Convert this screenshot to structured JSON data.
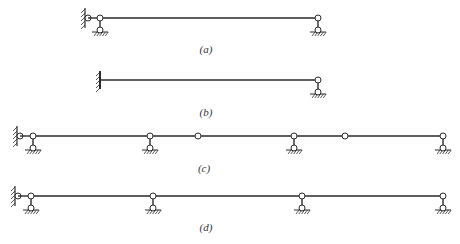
{
  "figure": {
    "background": "#ffffff",
    "line_color": "#2a2a2a",
    "diagrams": [
      {
        "id": "a",
        "label": "(a)",
        "label_pos": [
          206,
          50
        ],
        "beam_y": 18,
        "beam_x": [
          100,
          318
        ],
        "elements": [
          {
            "type": "wall-pin",
            "x": 88,
            "y": 18
          },
          {
            "type": "link-bar",
            "x1": 88,
            "x2": 100,
            "y": 18
          },
          {
            "type": "pinned-support",
            "x": 100,
            "y": 18
          },
          {
            "type": "pinned-support",
            "x": 318,
            "y": 18
          }
        ]
      },
      {
        "id": "b",
        "label": "(b)",
        "label_pos": [
          206,
          113
        ],
        "beam_y": 80,
        "beam_x": [
          100,
          318
        ],
        "elements": [
          {
            "type": "fixed-wall",
            "x": 100,
            "y": 80
          },
          {
            "type": "pinned-support",
            "x": 318,
            "y": 80
          }
        ]
      },
      {
        "id": "c",
        "label": "(c)",
        "label_pos": [
          204,
          169
        ],
        "beam_y": 136,
        "beam_x": [
          33,
          443
        ],
        "elements": [
          {
            "type": "wall-pin",
            "x": 20,
            "y": 136
          },
          {
            "type": "link-bar",
            "x1": 20,
            "x2": 33,
            "y": 136
          },
          {
            "type": "pinned-support",
            "x": 33,
            "y": 136
          },
          {
            "type": "pinned-support",
            "x": 150,
            "y": 136
          },
          {
            "type": "internal-hinge",
            "x": 198,
            "y": 136
          },
          {
            "type": "pinned-support",
            "x": 294,
            "y": 136
          },
          {
            "type": "internal-hinge",
            "x": 345,
            "y": 136
          },
          {
            "type": "pinned-support",
            "x": 443,
            "y": 136
          }
        ]
      },
      {
        "id": "d",
        "label": "(d)",
        "label_pos": [
          206,
          228
        ],
        "beam_y": 196,
        "beam_x": [
          31,
          443
        ],
        "elements": [
          {
            "type": "wall-pin",
            "x": 18,
            "y": 196
          },
          {
            "type": "link-bar",
            "x1": 18,
            "x2": 31,
            "y": 196
          },
          {
            "type": "pinned-support",
            "x": 31,
            "y": 196
          },
          {
            "type": "pinned-support",
            "x": 153,
            "y": 196
          },
          {
            "type": "pinned-support",
            "x": 302,
            "y": 196
          },
          {
            "type": "pinned-support",
            "x": 443,
            "y": 196
          }
        ]
      }
    ]
  }
}
